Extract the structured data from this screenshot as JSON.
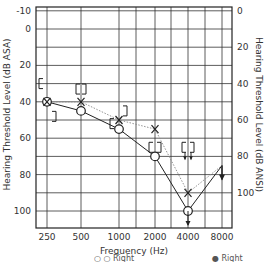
{
  "chart_data": {
    "type": "line",
    "title": "",
    "xlabel": "Frequency (Hz)",
    "ylabel_left": "Hearing Threshold Level (dB ASA)",
    "ylabel_right": "Hearing Threshold Level (dB ANSI)",
    "x_ticks": [
      "250",
      "500",
      "1000",
      "2000",
      "4000",
      "8000"
    ],
    "y_ticks_left": [
      "-10",
      "0",
      "20",
      "40",
      "60",
      "80",
      "100"
    ],
    "y_ticks_right": [
      "0",
      "20",
      "40",
      "60",
      "80",
      "100"
    ],
    "ylim_left": [
      -10,
      110
    ],
    "y_inverted": true,
    "grid": true,
    "series": [
      {
        "name": "Right air conduction",
        "marker": "O",
        "line": "solid",
        "x": [
          250,
          500,
          1000,
          2000,
          4000,
          8000
        ],
        "values": [
          40,
          45,
          55,
          70,
          100,
          75
        ],
        "no_response": [
          4000
        ]
      },
      {
        "name": "Left air conduction",
        "marker": "X",
        "line": "dotted",
        "x": [
          250,
          500,
          1000,
          2000,
          4000,
          8000
        ],
        "values": [
          40,
          40,
          50,
          55,
          90,
          75
        ]
      },
      {
        "name": "Right masked bone",
        "marker": "[",
        "x": [
          250,
          500,
          1000,
          2000,
          4000
        ],
        "values": [
          30,
          35,
          50,
          65,
          65
        ],
        "no_response": [
          4000
        ]
      },
      {
        "name": "Left masked bone",
        "marker": "]",
        "x": [
          250,
          500,
          1000,
          2000,
          4000
        ],
        "values": [
          45,
          35,
          45,
          65,
          65
        ],
        "no_response": [
          4000
        ]
      }
    ],
    "legend": [
      "Right",
      "Right"
    ],
    "legend_position": "bottom"
  }
}
